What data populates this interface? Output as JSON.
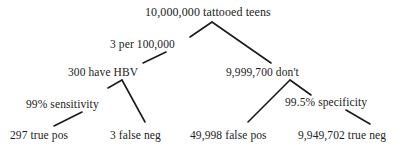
{
  "diagram": {
    "type": "probability-tree",
    "root": {
      "label": "10,000,000 tattooed teens"
    },
    "edge_labels": {
      "prevalence": "3 per 100,000",
      "sensitivity": "99% sensitivity",
      "specificity": "99.5% specificity"
    },
    "level1": {
      "infected": "300 have HBV",
      "not_infected": "9,999,700 don't"
    },
    "leaves": {
      "true_pos": "297 true pos",
      "false_neg": "3 false neg",
      "false_pos": "49,998 false pos",
      "true_neg": "9,949,702 true neg"
    },
    "colors": {
      "text": "#222222",
      "lines": "#1a1a1a",
      "background": "#ffffff"
    }
  }
}
